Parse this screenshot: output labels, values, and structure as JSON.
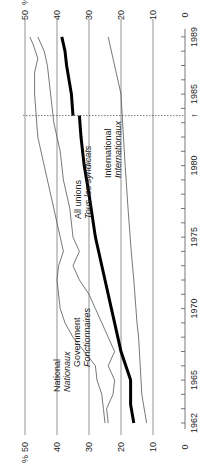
{
  "chart_data": {
    "type": "line",
    "orientation": "rotated-90",
    "title": "",
    "xlabel": "",
    "ylabel": "%",
    "x_range": [
      1962,
      1989
    ],
    "ylim": [
      0,
      50
    ],
    "grid": true,
    "x_ticks": [
      1962,
      1965,
      1970,
      1975,
      1980,
      1985,
      1989
    ],
    "x_tick_labels": [
      "1962",
      "1965",
      "1970",
      "1975",
      "1980",
      "1985",
      "1989"
    ],
    "y_ticks": [
      0,
      10,
      20,
      30,
      40,
      50
    ],
    "y_tick_labels": [
      "0",
      "10",
      "20",
      "30",
      "40",
      "50"
    ],
    "break_marker": {
      "year": 1983.5,
      "label": "↑"
    },
    "series": [
      {
        "name": "All unions / Tous les syndicats",
        "label_en": "All unions",
        "label_fr": "Tous les syndicats",
        "style": "bold",
        "points": [
          [
            1962,
            16
          ],
          [
            1963.3,
            17
          ],
          [
            1965,
            17
          ],
          [
            1966,
            18.5
          ],
          [
            1967,
            20
          ],
          [
            1968,
            21
          ],
          [
            1970,
            23
          ],
          [
            1972,
            25
          ],
          [
            1975,
            28
          ],
          [
            1978,
            30
          ],
          [
            1980,
            31.5
          ],
          [
            1982,
            32.5
          ],
          [
            1983.5,
            33
          ],
          [
            1983.5,
            35
          ],
          [
            1985,
            35.5
          ],
          [
            1987,
            37
          ],
          [
            1988,
            37.5
          ],
          [
            1989,
            38.5
          ]
        ]
      },
      {
        "name": "International / Internationaux",
        "label_en": "International",
        "label_fr": "Internationaux",
        "style": "thin",
        "points": [
          [
            1962,
            12
          ],
          [
            1964,
            13.5
          ],
          [
            1966,
            14
          ],
          [
            1968,
            14.5
          ],
          [
            1969,
            15
          ],
          [
            1972,
            16
          ],
          [
            1974,
            16.8
          ],
          [
            1977,
            17.8
          ],
          [
            1980,
            18.7
          ],
          [
            1983,
            19.5
          ],
          [
            1985,
            20
          ],
          [
            1986.5,
            21.5
          ],
          [
            1987.5,
            22.5
          ],
          [
            1989,
            24
          ]
        ]
      },
      {
        "name": "National / Nationaux",
        "label_en": "National",
        "label_fr": "Nationaux",
        "style": "thin",
        "points": [
          [
            1962,
            25
          ],
          [
            1963,
            25.5
          ],
          [
            1964,
            26
          ],
          [
            1965,
            27.5
          ],
          [
            1966,
            28
          ],
          [
            1968,
            35
          ],
          [
            1969,
            37.5
          ],
          [
            1970,
            39
          ],
          [
            1972,
            40
          ],
          [
            1973,
            39.5
          ],
          [
            1974,
            38
          ],
          [
            1976,
            40
          ],
          [
            1978,
            42
          ],
          [
            1980,
            44
          ],
          [
            1982,
            46
          ],
          [
            1983.5,
            46.5
          ],
          [
            1985,
            47
          ],
          [
            1986.5,
            47
          ],
          [
            1987.5,
            46
          ],
          [
            1988.5,
            47.5
          ],
          [
            1989,
            48.5
          ]
        ]
      },
      {
        "name": "Government / Fonctionnaires",
        "label_en": "Government",
        "label_fr": "Fonctionnaires",
        "style": "thin",
        "points": [
          [
            1962,
            24
          ],
          [
            1963,
            24.5
          ],
          [
            1964,
            22.5
          ],
          [
            1965,
            22
          ],
          [
            1966,
            24
          ],
          [
            1967,
            22
          ],
          [
            1968,
            24
          ],
          [
            1969,
            26
          ],
          [
            1970,
            28
          ],
          [
            1971,
            30
          ],
          [
            1972,
            33
          ],
          [
            1973,
            35
          ],
          [
            1974,
            33
          ],
          [
            1975,
            35
          ],
          [
            1977,
            36
          ],
          [
            1979,
            38
          ],
          [
            1981,
            39
          ],
          [
            1983,
            41
          ],
          [
            1985,
            42
          ],
          [
            1987,
            43
          ],
          [
            1988,
            44
          ],
          [
            1989,
            46
          ]
        ]
      }
    ]
  }
}
